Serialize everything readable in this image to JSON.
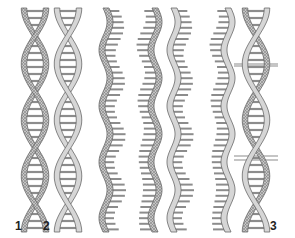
{
  "figure": {
    "labels": [
      {
        "text": "1",
        "x": 17,
        "y": 221
      },
      {
        "text": "2",
        "x": 45,
        "y": 221
      },
      {
        "text": "3",
        "x": 270,
        "y": 221
      }
    ],
    "colors": {
      "strand_dotted_fill": "#b8b8b8",
      "strand_plain_fill": "#d6d6d6",
      "strand_outline": "#6a6a6a",
      "rung": "#8c8c8c",
      "label": "#222222"
    },
    "structures": [
      {
        "id": "helix-1",
        "type": "double-helix",
        "strands": [
          "dotted",
          "dotted"
        ],
        "cx": 35
      },
      {
        "id": "helix-2",
        "type": "double-helix",
        "strands": [
          "plain",
          "plain"
        ],
        "cx": 68
      },
      {
        "id": "single-3",
        "type": "single-strand",
        "strand": "dotted",
        "rungs": "right",
        "cx": 106
      },
      {
        "id": "single-4",
        "type": "single-strand",
        "strand": "dotted",
        "rungs": "left",
        "cx": 155
      },
      {
        "id": "single-5",
        "type": "single-strand",
        "strand": "plain",
        "rungs": "right",
        "cx": 174
      },
      {
        "id": "single-6",
        "type": "single-strand",
        "strand": "plain",
        "rungs": "left",
        "cx": 228
      },
      {
        "id": "helix-7",
        "type": "double-helix",
        "strands": [
          "plain",
          "dotted"
        ],
        "cx": 256
      }
    ]
  }
}
